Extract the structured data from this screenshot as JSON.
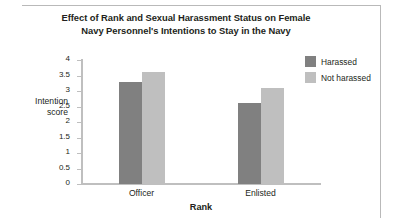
{
  "chart_data": {
    "type": "bar",
    "title": "Effect of Rank and Sexual Harassment Status on Female Navy Personnel's Intentions to Stay in the Navy",
    "title_lines": [
      "Effect of Rank and Sexual Harassment Status on Female",
      "Navy Personnel's Intentions to Stay in the Navy"
    ],
    "xlabel": "Rank",
    "ylabel": "Intention score",
    "ylabel_lines": [
      "Intention",
      "score"
    ],
    "categories": [
      "Officer",
      "Enlisted"
    ],
    "series": [
      {
        "name": "Harassed",
        "values": [
          3.3,
          2.6
        ],
        "color": "#808080"
      },
      {
        "name": "Not harassed",
        "values": [
          3.6,
          3.1
        ],
        "color": "#bfbfbf"
      }
    ],
    "ylim": [
      0,
      4
    ],
    "ytick_step": 0.5,
    "yticks": [
      "4",
      "3.5",
      "3",
      "2.5",
      "2",
      "1.5",
      "1",
      "0.5",
      "0"
    ],
    "grid": false,
    "legend_position": "right"
  },
  "legend": {
    "items": [
      {
        "label": "Harassed"
      },
      {
        "label": "Not harassed"
      }
    ]
  }
}
